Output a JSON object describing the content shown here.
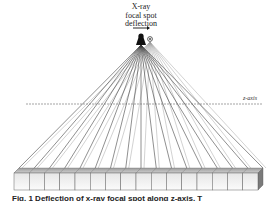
{
  "diagram": {
    "title_lines": [
      "X-ray",
      "focal spot",
      "deflection"
    ],
    "axis_label": "z-axis",
    "caption": "Fig. 1  Deflection of x-ray focal spot along z-axis. T",
    "source": {
      "x": 141,
      "y": 41,
      "deflected_x": 150,
      "deflected_y": 39
    },
    "detector": {
      "cells": 16,
      "x_start": 14,
      "x_end": 258,
      "top_y": 168,
      "front_top": 173,
      "front_bottom": 190
    },
    "colors": {
      "rays": "#333333",
      "rays_light": "#9a9a9a",
      "detector_face": "#f0f0f0",
      "detector_top": "#bdbdbd",
      "detector_side": "#7a7a7a",
      "axis": "#555555"
    }
  }
}
